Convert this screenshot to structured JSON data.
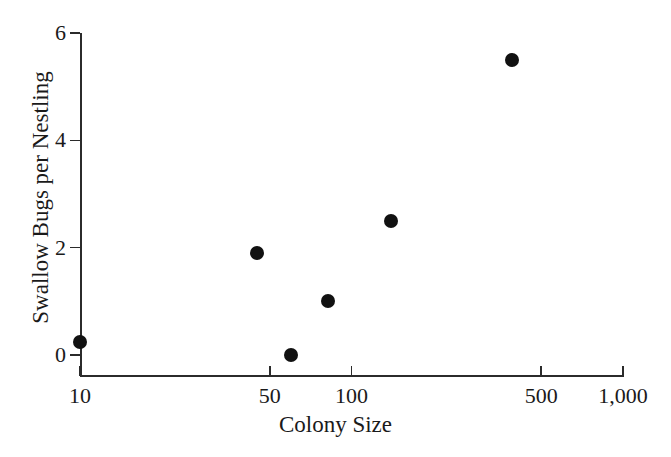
{
  "chart_data": {
    "type": "scatter",
    "title": "",
    "xlabel": "Colony Size",
    "ylabel": "Swallow Bugs per Nestling",
    "xscale": "log",
    "yscale": "linear",
    "xlim": [
      10,
      1000
    ],
    "ylim": [
      0,
      6
    ],
    "grid": false,
    "legend": null,
    "x_ticks": [
      10,
      50,
      100,
      500,
      1000
    ],
    "x_tick_labels": [
      "10",
      "50",
      "100",
      "500",
      "1,000"
    ],
    "y_ticks": [
      0,
      2,
      4,
      6
    ],
    "y_tick_labels": [
      "0",
      "2",
      "4",
      "6"
    ],
    "series": [
      {
        "name": "Swallow bugs per nestling vs colony size",
        "marker": "filled-circle",
        "color": "#111111",
        "points": [
          {
            "x": 10,
            "y": 0.25
          },
          {
            "x": 45,
            "y": 1.9
          },
          {
            "x": 60,
            "y": 0.0
          },
          {
            "x": 82,
            "y": 1.0
          },
          {
            "x": 140,
            "y": 2.5
          },
          {
            "x": 390,
            "y": 5.5
          }
        ]
      }
    ]
  },
  "axes": {
    "x_title": "Colony Size",
    "y_title": "Swallow Bugs per Nestling"
  }
}
